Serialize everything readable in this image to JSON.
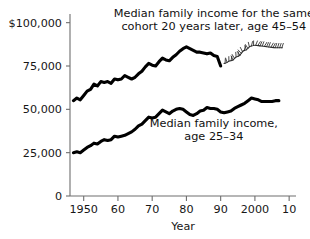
{
  "chart_data": {
    "type": "line",
    "title": "",
    "xlabel": "Year",
    "ylabel": "",
    "xlim": [
      1946,
      2012
    ],
    "ylim": [
      0,
      105000
    ],
    "grid": false,
    "legend_position": "inline-annotations",
    "y_ticks": [
      0,
      25000,
      50000,
      75000,
      100000
    ],
    "y_tick_labels": [
      "0",
      "25,000",
      "50,000",
      "75,000",
      "$100,000"
    ],
    "x_ticks": [
      1950,
      1960,
      1970,
      1980,
      1990,
      2000,
      2010
    ],
    "x_tick_labels": [
      "1950",
      "60",
      "70",
      "80",
      "90",
      "2000",
      "10"
    ],
    "series": [
      {
        "name": "Median family income for the same cohort 20 years later, age 45-54",
        "style": "solid-thick",
        "color": "#000000",
        "x": [
          1947,
          1948,
          1949,
          1950,
          1951,
          1952,
          1953,
          1954,
          1955,
          1956,
          1957,
          1958,
          1959,
          1960,
          1961,
          1962,
          1963,
          1964,
          1965,
          1966,
          1967,
          1968,
          1969,
          1970,
          1971,
          1972,
          1973,
          1974,
          1975,
          1976,
          1977,
          1978,
          1979,
          1980,
          1981,
          1982,
          1983,
          1984,
          1985,
          1986,
          1987,
          1988,
          1989,
          1990
        ],
        "values": [
          55000,
          56500,
          55500,
          58000,
          60500,
          61500,
          64500,
          63500,
          66000,
          65500,
          66000,
          65000,
          67500,
          67000,
          67500,
          69500,
          68500,
          67500,
          68500,
          70500,
          72000,
          74500,
          76500,
          75500,
          75000,
          77500,
          79500,
          78500,
          78000,
          80000,
          81500,
          83500,
          85000,
          86000,
          85000,
          84000,
          83000,
          83000,
          82500,
          82000,
          82500,
          81000,
          80500,
          75000
        ]
      },
      {
        "name": "Median family income, age 25-34",
        "style": "solid-thick",
        "color": "#000000",
        "x": [
          1947,
          1948,
          1949,
          1950,
          1951,
          1952,
          1953,
          1954,
          1955,
          1956,
          1957,
          1958,
          1959,
          1960,
          1961,
          1962,
          1963,
          1964,
          1965,
          1966,
          1967,
          1968,
          1969,
          1970,
          1971,
          1972,
          1973,
          1974,
          1975,
          1976,
          1977,
          1978,
          1979,
          1980,
          1981,
          1982,
          1983,
          1984,
          1985,
          1986,
          1987,
          1988,
          1989,
          1990,
          1991,
          1992,
          1993,
          1994,
          1995,
          1996,
          1997,
          1998,
          1999,
          2000,
          2001,
          2002,
          2003,
          2004,
          2005,
          2006,
          2007
        ],
        "values": [
          25000,
          25500,
          25000,
          26500,
          28000,
          29000,
          30500,
          30000,
          31500,
          32500,
          32000,
          32500,
          34500,
          34000,
          34500,
          35000,
          36000,
          37000,
          38500,
          40500,
          41500,
          43500,
          45500,
          45000,
          45500,
          47500,
          49500,
          48500,
          47500,
          49000,
          50000,
          50500,
          50000,
          48500,
          47000,
          46500,
          47500,
          49000,
          49500,
          51000,
          50500,
          50500,
          50000,
          48500,
          48000,
          48500,
          49000,
          50500,
          51500,
          52500,
          53500,
          55000,
          56500,
          56000,
          55500,
          54500,
          54500,
          54500,
          54500,
          55000,
          55000
        ]
      },
      {
        "name": "projection-hatched-extension",
        "style": "hatched-squiggle",
        "color": "#2b2b2b",
        "x": [
          1991,
          1993,
          1995,
          1997,
          1999,
          2000,
          2002,
          2004,
          2006,
          2008
        ],
        "values": [
          76500,
          78000,
          80500,
          84000,
          86500,
          87000,
          86500,
          86000,
          85500,
          85500
        ]
      }
    ],
    "annotations": [
      {
        "name": "upper-series-label",
        "lines": [
          "Median family income for the same",
          "cohort 20 years later, age 45–54"
        ],
        "x": 1988,
        "y": 103000
      },
      {
        "name": "lower-series-label",
        "lines": [
          "Median family income,",
          "age 25–34"
        ],
        "x": 1988,
        "y": 40000
      }
    ]
  }
}
